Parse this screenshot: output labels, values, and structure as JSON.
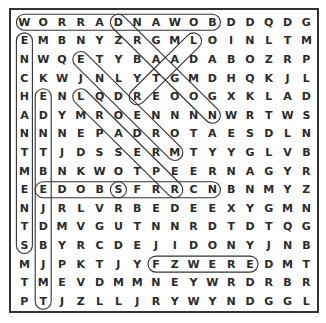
{
  "puzzle": {
    "rows": 16,
    "cols": 16,
    "grid": [
      [
        "W",
        "O",
        "R",
        "R",
        "A",
        "D",
        "N",
        "A",
        "W",
        "O",
        "B",
        "D",
        "D",
        "Q",
        "D",
        "G"
      ],
      [
        "E",
        "M",
        "B",
        "N",
        "Y",
        "Z",
        "R",
        "G",
        "M",
        "L",
        "O",
        "I",
        "N",
        "L",
        "T",
        "M"
      ],
      [
        "N",
        "W",
        "Q",
        "E",
        "T",
        "Y",
        "B",
        "A",
        "A",
        "D",
        "A",
        "B",
        "O",
        "Z",
        "R",
        "P"
      ],
      [
        "C",
        "K",
        "W",
        "J",
        "N",
        "L",
        "Y",
        "T",
        "G",
        "M",
        "D",
        "H",
        "Q",
        "K",
        "J",
        "L"
      ],
      [
        "H",
        "E",
        "N",
        "L",
        "Q",
        "D",
        "R",
        "E",
        "O",
        "O",
        "G",
        "X",
        "K",
        "L",
        "A",
        "D"
      ],
      [
        "A",
        "D",
        "Y",
        "M",
        "R",
        "O",
        "E",
        "N",
        "N",
        "N",
        "N",
        "W",
        "R",
        "T",
        "W",
        "S"
      ],
      [
        "N",
        "N",
        "N",
        "E",
        "P",
        "A",
        "D",
        "R",
        "O",
        "T",
        "A",
        "E",
        "S",
        "D",
        "L",
        "N"
      ],
      [
        "T",
        "T",
        "J",
        "D",
        "S",
        "S",
        "E",
        "R",
        "M",
        "T",
        "Y",
        "Y",
        "G",
        "L",
        "V",
        "B"
      ],
      [
        "M",
        "B",
        "N",
        "K",
        "W",
        "O",
        "T",
        "P",
        "E",
        "E",
        "R",
        "N",
        "A",
        "G",
        "Y",
        "R"
      ],
      [
        "E",
        "E",
        "D",
        "O",
        "B",
        "S",
        "F",
        "R",
        "R",
        "C",
        "N",
        "B",
        "N",
        "M",
        "Y",
        "Z"
      ],
      [
        "N",
        "J",
        "R",
        "L",
        "V",
        "R",
        "B",
        "E",
        "D",
        "E",
        "E",
        "X",
        "Y",
        "G",
        "M",
        "N"
      ],
      [
        "T",
        "D",
        "M",
        "V",
        "G",
        "U",
        "T",
        "N",
        "N",
        "R",
        "D",
        "T",
        "D",
        "T",
        "Q",
        "G"
      ],
      [
        "S",
        "B",
        "Y",
        "R",
        "C",
        "D",
        "E",
        "J",
        "I",
        "D",
        "O",
        "N",
        "Y",
        "J",
        "N",
        "B"
      ],
      [
        "M",
        "J",
        "P",
        "K",
        "T",
        "J",
        "Y",
        "F",
        "Z",
        "W",
        "E",
        "R",
        "E",
        "D",
        "M",
        "T"
      ],
      [
        "T",
        "M",
        "E",
        "V",
        "D",
        "M",
        "M",
        "N",
        "E",
        "Y",
        "W",
        "R",
        "D",
        "R",
        "B",
        "R"
      ],
      [
        "P",
        "T",
        "J",
        "Z",
        "L",
        "L",
        "J",
        "R",
        "Y",
        "W",
        "Y",
        "N",
        "D",
        "G",
        "G",
        "L"
      ]
    ],
    "found_words": [
      {
        "word": "BODWARROW",
        "start": [
          0,
          10
        ],
        "end": [
          0,
          0
        ],
        "direction": "horizontal"
      },
      {
        "word": "ENCHANTMENTS",
        "start": [
          1,
          0
        ],
        "end": [
          12,
          0
        ],
        "direction": "vertical"
      },
      {
        "word": "DRAGON",
        "start": [
          0,
          5
        ],
        "end": [
          5,
          10
        ],
        "direction": "diagonal-down-right"
      },
      {
        "word": "ETNDER",
        "start": [
          2,
          3
        ],
        "end": [
          7,
          8
        ],
        "direction": "diagonal-down-right"
      },
      {
        "word": "ENDYT",
        "start": [
          4,
          1
        ],
        "end": [
          15,
          1
        ],
        "direction": "diagonal"
      },
      {
        "word": "LQDEOAD",
        "start": [
          4,
          3
        ],
        "end": [
          9,
          8
        ],
        "direction": "diagonal-down-right"
      },
      {
        "word": "EDOBS",
        "start": [
          9,
          1
        ],
        "end": [
          9,
          5
        ],
        "direction": "horizontal"
      },
      {
        "word": "SFRRCN",
        "start": [
          9,
          5
        ],
        "end": [
          9,
          10
        ],
        "direction": "horizontal"
      },
      {
        "word": "FZWERE",
        "start": [
          13,
          7
        ],
        "end": [
          13,
          12
        ],
        "direction": "horizontal"
      },
      {
        "word": "LOL",
        "start": [
          1,
          9
        ],
        "end": [
          4,
          6
        ],
        "direction": "diagonal"
      }
    ],
    "colors": {
      "letters": "#2a2a2a",
      "border": "#333333",
      "highlight_stroke": "#333333",
      "background": "#ffffff"
    }
  }
}
